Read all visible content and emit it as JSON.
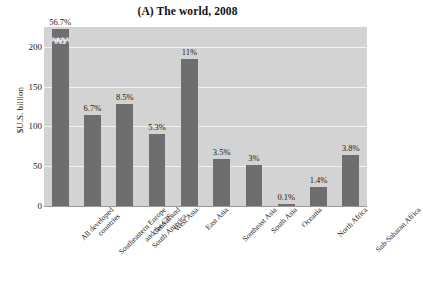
{
  "chart_data": {
    "type": "bar",
    "title": "(A) The world, 2008",
    "xlabel": "",
    "ylabel": "$U.S. billion",
    "ylim": [
      0,
      225
    ],
    "yticks": [
      0,
      50,
      100,
      150,
      200
    ],
    "grid": true,
    "legend": "none",
    "axis_break": {
      "present": true,
      "series_index": 0,
      "note": "first bar truncated with zig-zag break; true value shown inside bar"
    },
    "categories": [
      "All developed countries",
      "Southeastern Europe and the CIS",
      "Central and South America",
      "West Asia",
      "East Asia",
      "Southeast Asia",
      "South Asia",
      "Oceania",
      "North Africa",
      "Sub-Saharan Africa"
    ],
    "category_lines": [
      [
        "All developed",
        "countries"
      ],
      [
        "Southeastern Europe",
        "and the CIS"
      ],
      [
        "Central and",
        "South America"
      ],
      [
        "West Asia"
      ],
      [
        "East Asia"
      ],
      [
        "Southeast Asia"
      ],
      [
        "South Asia"
      ],
      [
        "Oceania"
      ],
      [
        "North Africa"
      ],
      [
        "Sub-Saharan Africa"
      ]
    ],
    "values": [
      962,
      114,
      128,
      91,
      185,
      59,
      51,
      2,
      24,
      64
    ],
    "drawn_values": [
      222,
      114,
      128,
      91,
      185,
      59,
      51,
      2,
      24,
      64
    ],
    "percent_labels": [
      "56.7%",
      "6.7%",
      "8.5%",
      "5.3%",
      "11%",
      "3.5%",
      "3%",
      "0.1%",
      "1.4%",
      "3.8%"
    ],
    "inner_value_labels": [
      "962",
      "",
      "",
      "",
      "",
      "",
      "",
      "",
      "",
      ""
    ],
    "colors": {
      "bar": "#6e6e6e",
      "plot_background": "#d3d3d3",
      "gridline": "#f2f2f2",
      "page_background": "#ffffff",
      "text": "#1a1a1a"
    }
  }
}
